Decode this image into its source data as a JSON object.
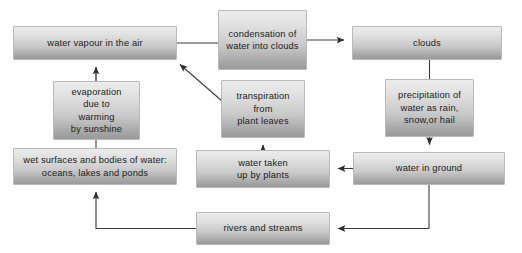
{
  "diagram": {
    "background_color": "#ffffff",
    "node_fill_top": "#ececec",
    "node_fill_bottom": "#9a9a9a",
    "node_border_color": "#b9b9b9",
    "connector_color": "#3a3a3a",
    "text_color": "#1c1c1c"
  },
  "nodes": [
    {
      "id": "water-vapour",
      "label": "water vapour in the air",
      "x": 13,
      "y": 26,
      "w": 164,
      "h": 34
    },
    {
      "id": "condensation",
      "label": "condensation of\nwater into clouds",
      "x": 218,
      "y": 10,
      "w": 89,
      "h": 60
    },
    {
      "id": "clouds",
      "label": "clouds",
      "x": 352,
      "y": 26,
      "w": 150,
      "h": 34
    },
    {
      "id": "evaporation",
      "label": "evaporation\ndue to\nwarming\nby sunshine",
      "x": 53,
      "y": 81,
      "w": 87,
      "h": 59
    },
    {
      "id": "transpiration",
      "label": "transpiration\nfrom\nplant leaves",
      "x": 221,
      "y": 80,
      "w": 84,
      "h": 58
    },
    {
      "id": "precipitation",
      "label": "precipitation of\nwater as rain,\nsnow,or hail",
      "x": 385,
      "y": 79,
      "w": 89,
      "h": 58
    },
    {
      "id": "wet-surfaces",
      "label": "wet surfaces and bodies of water:\noceans, lakes and ponds",
      "x": 13,
      "y": 148,
      "w": 164,
      "h": 37
    },
    {
      "id": "water-taken-up",
      "label": "water taken\nup by plants",
      "x": 196,
      "y": 150,
      "w": 134,
      "h": 38
    },
    {
      "id": "water-in-ground",
      "label": "water in ground",
      "x": 353,
      "y": 152,
      "w": 152,
      "h": 33
    },
    {
      "id": "rivers-streams",
      "label": "rivers and streams",
      "x": 196,
      "y": 212,
      "w": 134,
      "h": 33
    }
  ],
  "connectors": [
    {
      "id": "vapour-to-condensation",
      "from": "water-vapour",
      "to": "condensation",
      "kind": "line",
      "arrowhead": false
    },
    {
      "id": "condensation-to-clouds",
      "from": "condensation",
      "to": "clouds",
      "kind": "line",
      "arrowhead": true
    },
    {
      "id": "clouds-to-precipitation",
      "from": "clouds",
      "to": "precipitation",
      "kind": "line",
      "arrowhead": false
    },
    {
      "id": "precipitation-to-ground",
      "from": "precipitation",
      "to": "water-in-ground",
      "kind": "line",
      "arrowhead": true
    },
    {
      "id": "ground-to-taken-up",
      "from": "water-in-ground",
      "to": "water-taken-up",
      "kind": "line",
      "arrowhead": true
    },
    {
      "id": "taken-up-to-transpiration",
      "from": "water-taken-up",
      "to": "transpiration",
      "kind": "line",
      "arrowhead": true
    },
    {
      "id": "transpiration-to-vapour",
      "from": "transpiration",
      "to": "water-vapour",
      "kind": "diagonal",
      "arrowhead": true
    },
    {
      "id": "evaporation-to-vapour",
      "from": "evaporation",
      "to": "water-vapour",
      "kind": "line",
      "arrowhead": true
    },
    {
      "id": "wet-surfaces-to-evaporation",
      "from": "wet-surfaces",
      "to": "evaporation",
      "kind": "line",
      "arrowhead": false
    },
    {
      "id": "ground-to-rivers",
      "from": "water-in-ground",
      "to": "rivers-streams",
      "kind": "elbow",
      "arrowhead": true
    },
    {
      "id": "rivers-to-wet-surfaces",
      "from": "rivers-streams",
      "to": "wet-surfaces",
      "kind": "elbow",
      "arrowhead": true
    }
  ]
}
